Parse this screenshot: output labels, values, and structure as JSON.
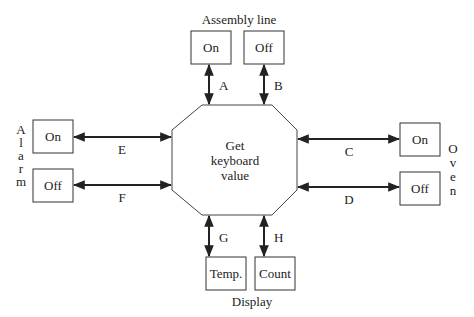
{
  "center": {
    "lines": [
      "Get",
      "keyboard",
      "value"
    ]
  },
  "groups": {
    "assembly_line": {
      "title": "Assembly line",
      "on": "On",
      "off": "Off"
    },
    "alarm": {
      "title_letters": [
        "A",
        "l",
        "a",
        "r",
        "m"
      ],
      "on": "On",
      "off": "Off"
    },
    "oven": {
      "title_letters": [
        "O",
        "v",
        "e",
        "n"
      ],
      "on": "On",
      "off": "Off"
    },
    "display": {
      "title": "Display",
      "temp": "Temp.",
      "count": "Count"
    }
  },
  "connections": {
    "A": "A",
    "B": "B",
    "C": "C",
    "D": "D",
    "E": "E",
    "F": "F",
    "G": "G",
    "H": "H"
  }
}
